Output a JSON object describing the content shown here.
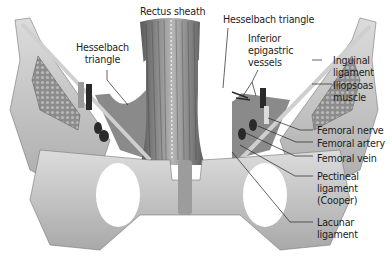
{
  "colors": {
    "bone": "#c9c9c9",
    "bone_shadow": "#8e8e8e",
    "muscle": "#7d7d7d",
    "rectus": "#8a8a8a",
    "vessel_dark": "#2a2a2a",
    "leader": "#222222",
    "label": "#1e1e1e"
  },
  "labels": {
    "rectus_sheath": "Rectus sheath",
    "hesselbach_left": "Hesselbach\ntriangle",
    "hesselbach_right": "Hesselbach triangle",
    "inferior_epigastric": "Inferior\nepigastric\nvessels",
    "inguinal_ligament": "Inguinal\nligament",
    "iliopsoas_muscle": "Iliopsoas\nmuscle",
    "femoral_nerve": "Femoral nerve",
    "femoral_artery": "Femoral artery",
    "femoral_vein": "Femoral vein",
    "pectineal_ligament": "Pectineal\nligament\n(Cooper)",
    "lacunar_ligament": "Lacunar\nligament"
  }
}
